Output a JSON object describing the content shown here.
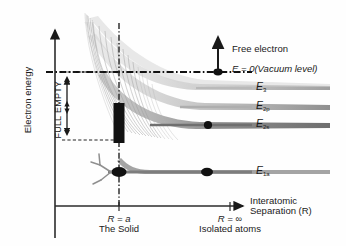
{
  "figure": {
    "type": "energy-band-formation-diagram",
    "axes": {
      "y_label": "Electron energy",
      "x_label_line1": "Interatomic",
      "x_label_line2": "Separation (R)"
    },
    "x_ticks": [
      {
        "label": "R = a",
        "sublabel": "The Solid",
        "x_frac": 0.345
      },
      {
        "label": "R = ∞",
        "sublabel": "Isolated atoms",
        "x_frac": 0.665
      }
    ],
    "annotations": {
      "free_electron": "Free electron",
      "vacuum_level": "E = 0(Vacuum level)",
      "band_fill_full": "FULL",
      "band_fill_empty": "EMPTY"
    },
    "levels": [
      {
        "name": "E3",
        "label_main": "E",
        "label_sub": "3",
        "y": 88,
        "marker": false,
        "shade": "#c9c9c9"
      },
      {
        "name": "E2p",
        "label_main": "E",
        "label_sub": "2p",
        "y": 107,
        "marker": false,
        "shade": "#bdbdbd"
      },
      {
        "name": "E2s",
        "label_main": "E",
        "label_sub": "2s",
        "y": 125,
        "marker": true,
        "shade": "#8a8a8a"
      },
      {
        "name": "E1a",
        "label_main": "E",
        "label_sub": "1a",
        "y": 172,
        "marker": true,
        "shade": "#8a8a8a"
      }
    ],
    "colors": {
      "ink": "#1a1a1a",
      "axis": "#2b2b2b",
      "band_light": "#d4d4d4",
      "band_mid": "#b0b0b0",
      "band_dark": "#7a7a7a",
      "filled_band": "#111111"
    },
    "vacuum_level_y": 72,
    "full_empty_bracket": {
      "top_y": 72,
      "bottom_y": 140,
      "x": 62
    }
  }
}
